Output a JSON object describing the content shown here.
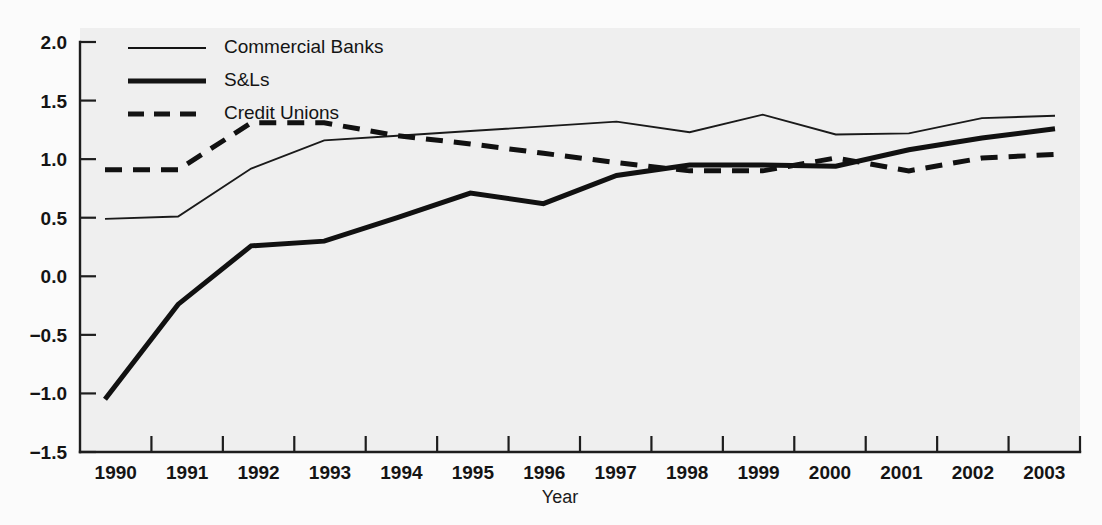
{
  "chart_data": {
    "type": "line",
    "title": "",
    "subtitle": "",
    "xlabel": "Year",
    "ylabel": "",
    "categories": [
      1990,
      1991,
      1992,
      1993,
      1994,
      1995,
      1996,
      1997,
      1998,
      1999,
      2000,
      2001,
      2002,
      2003
    ],
    "x_tick_labels": [
      "1990",
      "1991",
      "1992",
      "1993",
      "1994",
      "1995",
      "1996",
      "1997",
      "1998",
      "1999",
      "2000",
      "2001",
      "2002",
      "2003"
    ],
    "y_tick_labels": [
      "2.0",
      "1.5",
      "1.0",
      "0.5",
      "0.0",
      "−0.5",
      "−1.0",
      "−1.5"
    ],
    "y_tick_values": [
      2.0,
      1.5,
      1.0,
      0.5,
      0.0,
      -0.5,
      -1.0,
      -1.5
    ],
    "ylim": [
      -1.5,
      2.0
    ],
    "xlim": [
      1990,
      2003
    ],
    "grid": false,
    "legend_position": "top-left",
    "series": [
      {
        "name": "Commercial Banks",
        "style": "solid-thin",
        "color": "#1a1a1a",
        "values": [
          0.49,
          0.51,
          0.92,
          1.16,
          1.2,
          1.24,
          1.28,
          1.32,
          1.23,
          1.38,
          1.21,
          1.22,
          1.35,
          1.37
        ]
      },
      {
        "name": "S&Ls",
        "style": "solid-thick",
        "color": "#111111",
        "values": [
          -1.05,
          -0.24,
          0.26,
          0.3,
          0.5,
          0.71,
          0.62,
          0.86,
          0.95,
          0.95,
          0.94,
          1.08,
          1.18,
          1.26
        ]
      },
      {
        "name": "Credit Unions",
        "style": "dashed-thick",
        "color": "#111111",
        "values": [
          0.91,
          0.91,
          1.31,
          1.31,
          1.2,
          1.13,
          1.05,
          0.97,
          0.9,
          0.9,
          1.01,
          0.9,
          1.01,
          1.04
        ]
      }
    ]
  },
  "legend": {
    "items": [
      {
        "label": "Commercial Banks",
        "style": "solid-thin"
      },
      {
        "label": "S&Ls",
        "style": "solid-thick"
      },
      {
        "label": "Credit Unions",
        "style": "dashed-thick"
      }
    ]
  },
  "axes": {
    "x_title": "Year"
  },
  "colors": {
    "ink": "#1a1a1a",
    "plot_background": "#efefef",
    "page_background": "#fbfbfb"
  }
}
